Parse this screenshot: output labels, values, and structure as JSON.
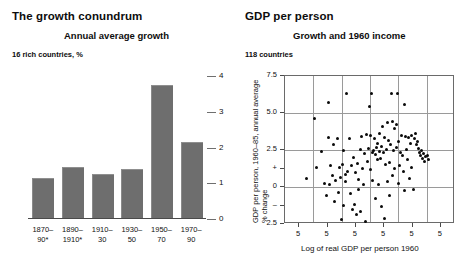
{
  "left_panel": {
    "title": "The growth conundrum",
    "subtitle": "Annual average growth",
    "unit_note": "16 rich countries, %"
  },
  "right_panel": {
    "title": "GDP per person",
    "subtitle": "Growth and 1960 income",
    "unit_note": "118 countries"
  },
  "chart_data": [
    {
      "type": "bar",
      "title": "Annual average growth",
      "subtitle": "16 rich countries, %",
      "panel_title": "The growth conundrum",
      "categories": [
        "1870–90*",
        "1890–1910*",
        "1910–30",
        "1930–50",
        "1950–70",
        "1970–90"
      ],
      "category_lines": [
        [
          "1870–",
          "90*"
        ],
        [
          "1890–",
          "1910*"
        ],
        [
          "1910–",
          "30"
        ],
        [
          "1930–",
          "50"
        ],
        [
          "1950–",
          "70"
        ],
        [
          "1970–",
          "90"
        ]
      ],
      "values": [
        1.1,
        1.4,
        1.2,
        1.35,
        3.7,
        2.1
      ],
      "xlabel": "",
      "ylabel": "",
      "ylim": [
        0,
        4
      ],
      "yticks": [
        0,
        1,
        2,
        3,
        4
      ],
      "ytick_labels": [
        "0",
        "1",
        "2",
        "3",
        "4"
      ],
      "axis_side": "right",
      "grid": false,
      "bar_color": "#6e6e6e"
    },
    {
      "type": "scatter",
      "title": "Growth and 1960 income",
      "subtitle": "118 countries",
      "panel_title": "GDP per person",
      "xlabel": "Log of real GDP per person 1960",
      "ylabel": "GDP per person, 1960–85, annual average % change",
      "ylim": [
        -2.5,
        7.5
      ],
      "yticks": [
        7.5,
        5.0,
        2.5,
        1.25,
        0,
        -1.25,
        -2.5
      ],
      "ytick_labels": [
        "7.5",
        "5.0",
        "2.5",
        "+",
        "0",
        "–",
        "2.5"
      ],
      "xlim": [
        0,
        6
      ],
      "xticks": [
        0.5,
        1.5,
        2.5,
        3.5,
        4.5,
        5.5
      ],
      "xtick_labels": [
        "5",
        "5",
        "5",
        "5",
        "5",
        "5"
      ],
      "grid": true,
      "gridlines_vertical": 5,
      "gridlines_horizontal": 3,
      "n_points": 118,
      "point_color": "#0a0a0a",
      "points": [
        [
          1.05,
          4.65
        ],
        [
          0.75,
          0.55
        ],
        [
          1.28,
          2.4
        ],
        [
          1.12,
          1.35
        ],
        [
          1.55,
          5.7
        ],
        [
          1.38,
          0.25
        ],
        [
          1.52,
          3.35
        ],
        [
          1.48,
          -0.55
        ],
        [
          1.62,
          1.45
        ],
        [
          1.72,
          2.85
        ],
        [
          1.66,
          0.75
        ],
        [
          1.58,
          0.15
        ],
        [
          1.78,
          0.45
        ],
        [
          1.85,
          3.25
        ],
        [
          1.92,
          1.3
        ],
        [
          1.74,
          -0.95
        ],
        [
          1.88,
          -0.35
        ],
        [
          1.95,
          0.65
        ],
        [
          2.02,
          1.55
        ],
        [
          2.08,
          2.45
        ],
        [
          1.98,
          -2.2
        ],
        [
          2.12,
          0.35
        ],
        [
          2.05,
          -1.25
        ],
        [
          2.18,
          6.3
        ],
        [
          2.22,
          1.05
        ],
        [
          2.28,
          3.3
        ],
        [
          2.15,
          0.85
        ],
        [
          2.35,
          1.45
        ],
        [
          2.42,
          2.0
        ],
        [
          2.32,
          -0.45
        ],
        [
          2.48,
          0.95
        ],
        [
          2.55,
          1.6
        ],
        [
          2.38,
          -1.5
        ],
        [
          2.52,
          -1.85
        ],
        [
          2.6,
          0.5
        ],
        [
          2.45,
          -1.15
        ],
        [
          2.65,
          2.55
        ],
        [
          2.7,
          3.4
        ],
        [
          2.58,
          -0.15
        ],
        [
          2.75,
          1.25
        ],
        [
          2.68,
          -1.65
        ],
        [
          2.82,
          2.25
        ],
        [
          2.88,
          3.55
        ],
        [
          2.78,
          0.2
        ],
        [
          2.92,
          1.75
        ],
        [
          2.85,
          -2.35
        ],
        [
          2.95,
          2.6
        ],
        [
          3.02,
          3.45
        ],
        [
          2.98,
          5.45
        ],
        [
          3.05,
          6.35
        ],
        [
          3.08,
          2.35
        ],
        [
          3.0,
          1.15
        ],
        [
          3.12,
          2.5
        ],
        [
          3.15,
          3.3
        ],
        [
          3.18,
          2.2
        ],
        [
          3.1,
          0.45
        ],
        [
          3.22,
          2.65
        ],
        [
          3.25,
          1.85
        ],
        [
          3.2,
          -0.75
        ],
        [
          3.28,
          2.95
        ],
        [
          3.32,
          3.6
        ],
        [
          3.35,
          2.4
        ],
        [
          3.3,
          0.15
        ],
        [
          3.38,
          1.95
        ],
        [
          3.42,
          2.75
        ],
        [
          3.45,
          4.1
        ],
        [
          3.4,
          -1.35
        ],
        [
          3.48,
          2.3
        ],
        [
          3.52,
          3.35
        ],
        [
          3.55,
          1.55
        ],
        [
          3.5,
          -2.15
        ],
        [
          3.58,
          2.55
        ],
        [
          3.62,
          4.35
        ],
        [
          3.65,
          3.15
        ],
        [
          3.6,
          0.35
        ],
        [
          3.68,
          1.65
        ],
        [
          3.72,
          2.85
        ],
        [
          3.75,
          6.35
        ],
        [
          3.78,
          4.4
        ],
        [
          3.7,
          -0.55
        ],
        [
          3.82,
          2.45
        ],
        [
          3.85,
          3.95
        ],
        [
          3.88,
          1.25
        ],
        [
          3.8,
          0.75
        ],
        [
          3.92,
          2.65
        ],
        [
          3.95,
          4.2
        ],
        [
          3.98,
          6.3
        ],
        [
          4.02,
          3.05
        ],
        [
          4.05,
          1.45
        ],
        [
          4.08,
          2.35
        ],
        [
          4.0,
          0.25
        ],
        [
          4.12,
          3.45
        ],
        [
          4.15,
          2.15
        ],
        [
          4.18,
          1.05
        ],
        [
          4.22,
          5.55
        ],
        [
          4.25,
          3.4
        ],
        [
          4.28,
          2.55
        ],
        [
          4.2,
          -0.25
        ],
        [
          4.32,
          1.85
        ],
        [
          4.35,
          3.35
        ],
        [
          4.38,
          0.55
        ],
        [
          4.42,
          2.95
        ],
        [
          4.45,
          3.45
        ],
        [
          4.48,
          1.35
        ],
        [
          4.52,
          -0.15
        ],
        [
          4.58,
          3.25
        ],
        [
          4.62,
          3.6
        ],
        [
          4.65,
          2.85
        ],
        [
          4.68,
          3.1
        ],
        [
          4.72,
          2.6
        ],
        [
          4.75,
          2.35
        ],
        [
          4.78,
          2.15
        ],
        [
          4.82,
          2.45
        ],
        [
          4.85,
          1.95
        ],
        [
          4.88,
          2.25
        ],
        [
          4.92,
          1.75
        ],
        [
          4.95,
          2.05
        ],
        [
          5.02,
          2.15
        ],
        [
          5.05,
          1.85
        ]
      ]
    }
  ]
}
